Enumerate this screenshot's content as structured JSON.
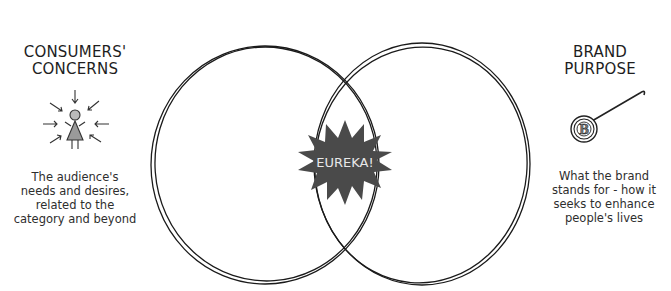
{
  "left": {
    "title_line1": "CONSUMERS'",
    "title_line2": "CONCERNS",
    "icon": "person-with-inward-arrows-icon",
    "desc_lines": [
      "The audience's",
      "needs and desires,",
      "related to the",
      "category and beyond"
    ]
  },
  "right": {
    "title_line1": "BRAND",
    "title_line2": "PURPOSE",
    "icon": "brand-badge-pin-icon",
    "badge_letter": "B",
    "desc_lines": [
      "What the brand",
      "stands for - how it",
      "seeks to enhance",
      "people's lives"
    ]
  },
  "center": {
    "label": "EUREKA!",
    "star_color": "#4a4a4a"
  },
  "colors": {
    "line": "#1a1a1a",
    "figure_fill": "#9a9a9a"
  }
}
